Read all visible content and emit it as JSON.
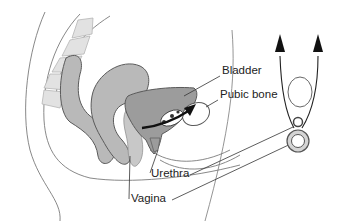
{
  "diagram": {
    "type": "anatomical-illustration",
    "labels": [
      {
        "id": "bladder",
        "text": "Bladder",
        "x": 221,
        "y": 71
      },
      {
        "id": "pubic-bone",
        "text": "Pubic bone",
        "x": 220,
        "y": 95
      },
      {
        "id": "urethra",
        "text": "Urethra",
        "x": 151,
        "y": 171
      },
      {
        "id": "vagina",
        "text": "Vagina",
        "x": 131,
        "y": 197
      }
    ],
    "colors": {
      "tissue_fill": "#b9b9b9",
      "tissue_stroke": "#5a5a5a",
      "spine_fill": "#e2e2e2",
      "outline": "#7a7a7a",
      "arrow": "#111111",
      "background": "#ffffff"
    }
  }
}
